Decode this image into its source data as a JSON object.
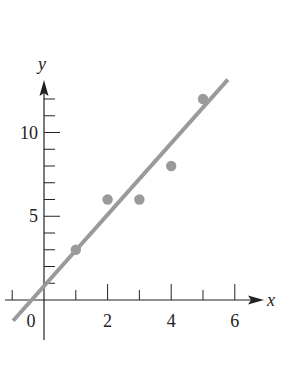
{
  "chart_data": {
    "type": "scatter",
    "title": "",
    "xlabel": "x",
    "ylabel": "y",
    "xlim": [
      -1,
      6.8
    ],
    "ylim": [
      -1.5,
      13
    ],
    "x_ticks": [
      -1,
      0,
      1,
      2,
      3,
      4,
      5,
      6
    ],
    "x_tick_labels": [
      {
        "value": 0,
        "text": "0"
      },
      {
        "value": 2,
        "text": "2"
      },
      {
        "value": 4,
        "text": "4"
      },
      {
        "value": 6,
        "text": "6"
      }
    ],
    "y_ticks": [
      1,
      2,
      3,
      4,
      5,
      6,
      7,
      8,
      9,
      10,
      11,
      12
    ],
    "y_tick_labels": [
      {
        "value": 5,
        "text": "5"
      },
      {
        "value": 10,
        "text": "10"
      }
    ],
    "grid": false,
    "legend": null,
    "series": [
      {
        "name": "data points",
        "kind": "scatter",
        "x": [
          1,
          2,
          3,
          4,
          5
        ],
        "y": [
          3,
          6,
          6,
          8,
          12
        ]
      },
      {
        "name": "best fit line",
        "kind": "line",
        "equation": "y = 2x + 1",
        "slope": 2,
        "intercept": 1,
        "x_range": [
          -0.97,
          5.78
        ]
      }
    ],
    "colors": {
      "points": "#9a9a9a",
      "line": "#9a9a9a",
      "axes": "#222222"
    }
  }
}
